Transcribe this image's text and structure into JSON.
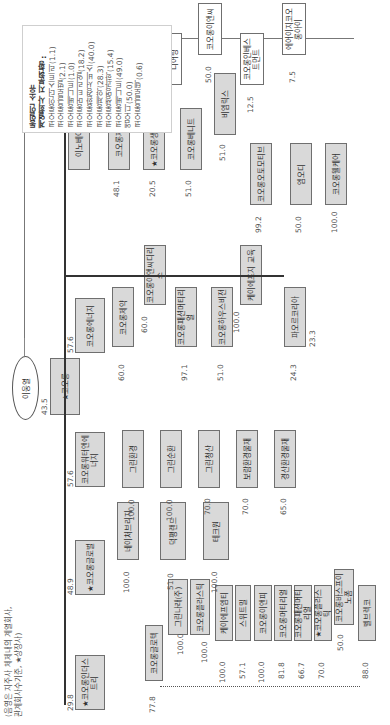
{
  "legend": {
    "title_line1": "동일인 소유",
    "title_line2": "계열회사 지분현황 :",
    "items": [
      "코오롱인더스트리(1.1)",
      "코오롱글로벌(2.1)",
      "코오롱베니트(1.0)",
      "코오롱머티리얼(18.2)",
      "코오롱환경서비스(40.0)",
      "코오롱제약(28.3)",
      "코오롱생명과학(15.4)",
      "코오롱베니트(49.0)",
      "엠오디(50.0)",
      "코오롱글로텍(0.6)"
    ]
  },
  "note": {
    "line1": "(음영은 지주사 체제내의 계열회사,",
    "line2": "관계회사수기준, ★상장사)"
  },
  "owner": {
    "label": "이웅열",
    "stake": "43.5"
  },
  "holding": {
    "label": "★코오롱"
  },
  "level2": [
    {
      "label": "★코오롱인더스트리",
      "stake": "29.8"
    },
    {
      "label": "★코오롱글로벌",
      "stake": "48.9"
    },
    {
      "label": "코오롱워터앤에너지",
      "stake": "57.6"
    },
    {
      "label": "코오롱에너지",
      "stake": "57.6"
    }
  ],
  "industry_children": [
    {
      "label": "코오롱글로텍",
      "stake": "77.8"
    },
    {
      "label": "그린나래(주)",
      "stake": "100.0"
    },
    {
      "label": "코오롱플라스틱",
      "stake": "100.0"
    },
    {
      "label": "케이에프엠티",
      "stake": "100.0"
    },
    {
      "label": "스위트밀",
      "stake": "57.1"
    },
    {
      "label": "코오롱이앤피",
      "stake": "100.0"
    },
    {
      "label": "코오롱머티리얼",
      "stake": "81.8"
    },
    {
      "label": "코오롱패션머티리얼",
      "stake": "66.7"
    },
    {
      "label": "★코오롱플라스틱",
      "stake": "70.0"
    },
    {
      "label": "코오롱바스프이노폼",
      "stake": "50.0"
    },
    {
      "label": "벨브렉코",
      "stake": "88.0"
    }
  ],
  "global_children": [
    {
      "label": "네이처브리지",
      "stake": "100.0"
    },
    {
      "label": "덕평랜드",
      "stake": "51.0"
    },
    {
      "label": "테크원",
      "stake": "100.0"
    }
  ],
  "water_children": [
    {
      "label": "그린환경",
      "stake": "100.0"
    },
    {
      "label": "그린순환",
      "stake": "100.0"
    },
    {
      "label": "그린청산",
      "stake": "70.0"
    },
    {
      "label": "보람환경물재",
      "stake": "70.0"
    },
    {
      "label": "경산환경물재",
      "stake": "65.0"
    }
  ],
  "energy_children": [
    {
      "label": "코오롱제약",
      "stake": "60.0"
    },
    {
      "label": "코오롱이앤씨디리스",
      "stake": "60.0"
    },
    {
      "label": "코오롱패션머티리얼",
      "stake": "97.1"
    },
    {
      "label": "코오롱하우스비전",
      "stake": "51.0"
    },
    {
      "label": "케이에프지 교육",
      "stake": "100.0"
    },
    {
      "label": "파오르코리아",
      "stake": "24.3"
    }
  ],
  "top_row": [
    {
      "label": "이노베이스",
      "stake": "100.0"
    },
    {
      "label": "코오롱제약",
      "stake": "48.1"
    },
    {
      "label": "★코오롱생명과학",
      "stake": "20.5"
    },
    {
      "label": "코오롱베니트",
      "stake": "51.0"
    },
    {
      "label": "비엠릭스",
      "stake": "51.0"
    },
    {
      "label": "코오롱오토모티브",
      "stake": "99.2"
    },
    {
      "label": "엠오디",
      "stake": "50.0"
    },
    {
      "label": "코오롱웰케어",
      "stake": "100.0"
    }
  ],
  "external": [
    {
      "label": "더블유파트너스",
      "stake": "100.0"
    },
    {
      "label": "코오롱이앤지니어링",
      "stake": "79.5"
    },
    {
      "label": "코오롱이앤씨",
      "stake": "50.0"
    },
    {
      "label": "코오롱인베스트먼트",
      "stake": "12.5"
    },
    {
      "label": "에어이지코오롱아이",
      "stake": "7.5"
    }
  ],
  "misc": {
    "pao_stake_right": "23.3"
  }
}
